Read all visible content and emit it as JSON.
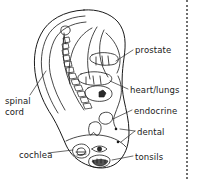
{
  "diagram": {
    "subject": "ear",
    "line_color": "#1a1a1a",
    "background_color": "#ffffff",
    "border": {
      "name": "right-dotted-border",
      "style": "dotted",
      "color": "#6f6f6f",
      "position": "right"
    },
    "labels": [
      {
        "id": "spinal-cord",
        "text_line1": "spinal",
        "text_line2": "cord",
        "side": "left"
      },
      {
        "id": "cochlea",
        "text": "cochlea",
        "side": "left"
      },
      {
        "id": "prostate",
        "text": "prostate",
        "side": "right"
      },
      {
        "id": "heart-lungs",
        "text": "heart/lungs",
        "side": "right"
      },
      {
        "id": "endocrine",
        "text": "endocrine",
        "side": "right"
      },
      {
        "id": "dental",
        "text": "dental",
        "side": "right"
      },
      {
        "id": "tonsils",
        "text": "tonsils",
        "side": "right"
      }
    ]
  }
}
